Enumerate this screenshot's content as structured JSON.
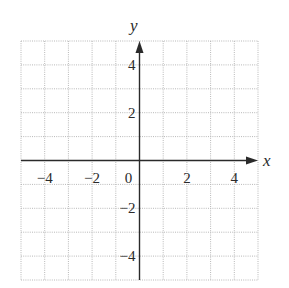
{
  "chart_data": {
    "type": "scatter",
    "title": "",
    "xlabel": "x",
    "ylabel": "y",
    "xlim": [
      -5,
      5
    ],
    "ylim": [
      -5,
      5
    ],
    "grid": true,
    "grid_step": 1,
    "x_ticks": [
      {
        "value": -4,
        "label": "−4"
      },
      {
        "value": -2,
        "label": "−2"
      },
      {
        "value": 0,
        "label": "0"
      },
      {
        "value": 2,
        "label": "2"
      },
      {
        "value": 4,
        "label": "4"
      }
    ],
    "y_ticks": [
      {
        "value": 4,
        "label": "4"
      },
      {
        "value": 2,
        "label": "2"
      },
      {
        "value": -2,
        "label": "−2"
      },
      {
        "value": -4,
        "label": "−4"
      }
    ],
    "series": [],
    "legend": null
  },
  "colors": {
    "grid": "#b8b8b8",
    "axis": "#2a2a2a",
    "background": "#ffffff"
  }
}
